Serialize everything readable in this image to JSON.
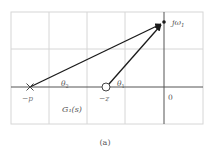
{
  "figure": {
    "caption": "(a)",
    "grid": {
      "left": 11,
      "top": 12,
      "right": 203,
      "bottom": 124,
      "vlines": [
        11,
        49,
        87,
        125,
        164,
        203
      ],
      "hlines": [
        12,
        49,
        87,
        124
      ],
      "line_color": "#d6d6d6"
    },
    "axes": {
      "real_axis_y": 87,
      "imag_axis_x": 164,
      "axis_color": "#555555"
    },
    "pole": {
      "label": "−p",
      "x": 30,
      "y": 87
    },
    "zero": {
      "label": "−z",
      "x": 106,
      "y": 87,
      "r": 4
    },
    "test_point": {
      "label": "jω",
      "subscript": "1",
      "x": 164,
      "y": 22
    },
    "origin_label": "0",
    "angles": [
      {
        "label": "θ",
        "subscript": "2"
      },
      {
        "label": "θ",
        "subscript": "1"
      }
    ],
    "transfer_function_label": "G₁(s)",
    "vector_color": "#1a1a1a",
    "label_color": "#555555"
  }
}
